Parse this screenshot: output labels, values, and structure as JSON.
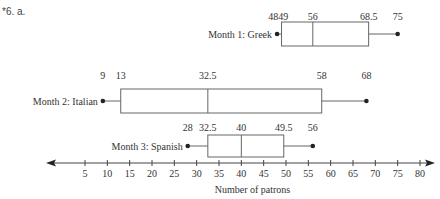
{
  "problem": {
    "label": "*6. a."
  },
  "chart_data": {
    "type": "boxplot",
    "title": "",
    "xlabel": "Number of patrons",
    "ylabel": "",
    "xlim": [
      5,
      80
    ],
    "xticks": [
      5,
      10,
      15,
      20,
      25,
      30,
      35,
      40,
      45,
      50,
      55,
      60,
      65,
      70,
      75,
      80
    ],
    "series": [
      {
        "name": "Month 1: Greek",
        "min": 48,
        "q1": 49,
        "median": 56,
        "q3": 68.5,
        "max": 75,
        "labels": [
          "4849",
          "56",
          "68.5",
          "75"
        ]
      },
      {
        "name": "Month 2: Italian",
        "min": 9,
        "q1": 13,
        "median": 32.5,
        "q3": 58,
        "max": 68,
        "labels": [
          "9",
          "13",
          "32.5",
          "58",
          "68"
        ]
      },
      {
        "name": "Month 3: Spanish",
        "min": 28,
        "q1": 32.5,
        "median": 40,
        "q3": 49.5,
        "max": 56,
        "labels": [
          "28",
          "32.5",
          "40",
          "49.5",
          "56"
        ]
      }
    ],
    "axis_arrows": "both",
    "grid": false
  }
}
